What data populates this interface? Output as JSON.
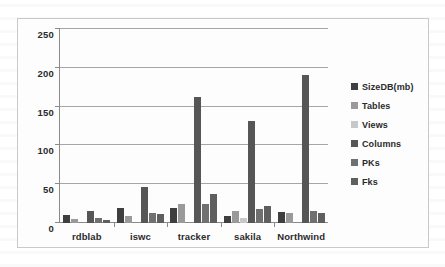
{
  "chart_data": {
    "type": "bar",
    "title": "",
    "subtitle": "",
    "xlabel": "",
    "ylabel": "",
    "categories": [
      "rdblab",
      "iswc",
      "tracker",
      "sakila",
      "Northwind"
    ],
    "series": [
      {
        "name": "SizeDB(mb)",
        "color": "#3f3f3f",
        "values": [
          10,
          19,
          19,
          9,
          14
        ]
      },
      {
        "name": "Tables",
        "color": "#9a9a9a",
        "values": [
          5,
          9,
          24,
          15,
          13
        ]
      },
      {
        "name": "Views",
        "color": "#c8c8c8",
        "values": [
          0,
          0,
          0,
          6,
          0
        ]
      },
      {
        "name": "Columns",
        "color": "#565656",
        "values": [
          16,
          47,
          162,
          131,
          191
        ]
      },
      {
        "name": "PKs",
        "color": "#707070",
        "values": [
          6,
          13,
          24,
          18,
          16
        ]
      },
      {
        "name": "Fks",
        "color": "#5f5f5f",
        "values": [
          4,
          11,
          38,
          22,
          13
        ]
      }
    ],
    "ylim": [
      0,
      250
    ],
    "yticks": [
      0,
      50,
      100,
      150,
      200,
      250
    ],
    "ytick_labels": [
      "0",
      "50",
      "100",
      "150",
      "200",
      "250"
    ],
    "grid": "horizontal",
    "legend_position": "right",
    "plot_background": "#fdfdfd",
    "gridline_color": "#a6a6a6",
    "axis_color": "#8a8a8a",
    "border_color": "#c9c9c9"
  }
}
